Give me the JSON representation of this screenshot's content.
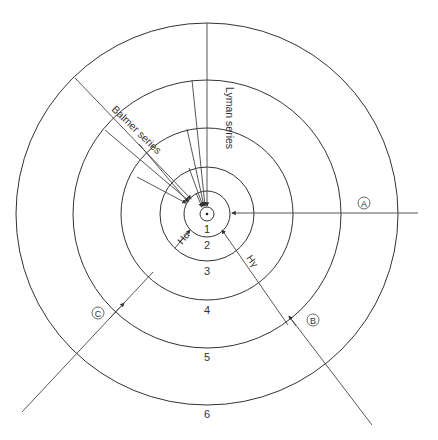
{
  "diagram": {
    "center": {
      "x": 207,
      "y": 214
    },
    "levels": [
      {
        "n": "1",
        "r": 7
      },
      {
        "n": "2",
        "r": 23
      },
      {
        "n": "3",
        "r": 47
      },
      {
        "n": "4",
        "r": 86
      },
      {
        "n": "5",
        "r": 134
      },
      {
        "n": "6",
        "r": 191
      }
    ],
    "level_labels": [
      "1",
      "2",
      "3",
      "4",
      "5",
      "6"
    ],
    "series": {
      "lyman": "Lyman series",
      "balmer": "Balmer series"
    },
    "transitions": {
      "h_alpha": "Hα",
      "h_gamma": "Hγ"
    },
    "markers": {
      "a": "A",
      "b": "B",
      "c": "C"
    }
  }
}
